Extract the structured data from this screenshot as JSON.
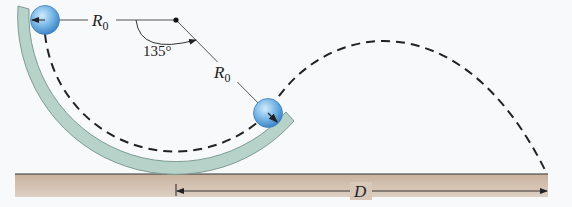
{
  "diagram": {
    "labels": {
      "radius_top": "R",
      "radius_top_sub": "0",
      "radius_diag": "R",
      "radius_diag_sub": "0",
      "angle": "135°",
      "distance": "D"
    },
    "angle_degrees": 135,
    "colors": {
      "background": "#f7f9fa",
      "track_fill": "#b7d3c9",
      "track_stroke": "#6f8d84",
      "ground_fill": "#cdb7a3",
      "ground_line": "#333333",
      "ball_fill": "#5fa3dc",
      "ball_highlight": "#bfe0f8",
      "line": "#555555",
      "dash": "#222222"
    }
  }
}
